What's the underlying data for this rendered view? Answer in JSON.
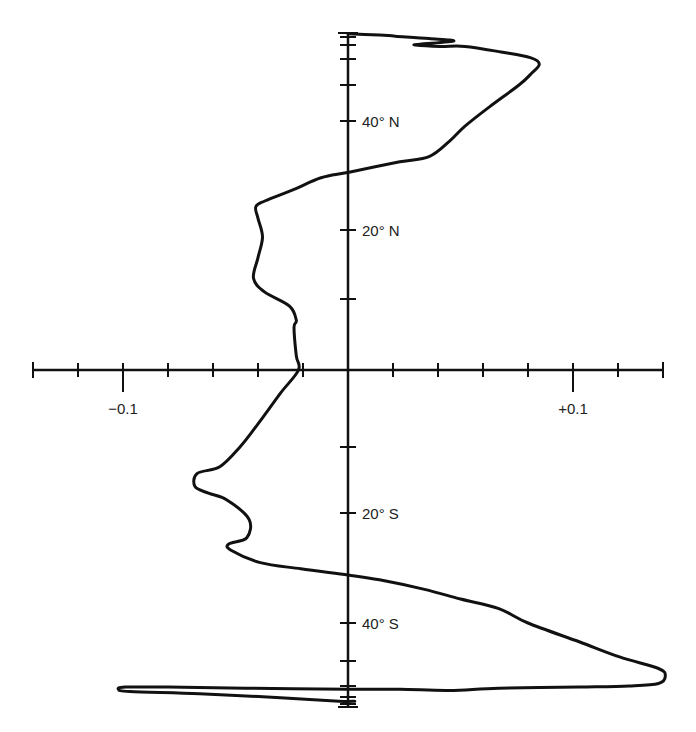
{
  "chart_data": {
    "type": "line",
    "title": "",
    "xlabel": "",
    "ylabel": "",
    "x_ticks": [
      -0.14,
      -0.12,
      -0.1,
      -0.08,
      -0.06,
      -0.04,
      -0.02,
      0,
      0.02,
      0.04,
      0.06,
      0.08,
      0.1,
      0.12,
      0.14
    ],
    "x_tick_labels": [
      {
        "value": -0.1,
        "label": "−0.1"
      },
      {
        "value": 0.1,
        "label": "+0.1"
      }
    ],
    "xlim": [
      -0.14,
      0.14
    ],
    "y_ticks_lat": [
      -90,
      -80,
      -70,
      -60,
      -50,
      -40,
      -20,
      -10,
      0,
      10,
      20,
      40,
      50,
      60,
      70,
      80,
      90
    ],
    "y_tick_labels": [
      {
        "lat": 40,
        "label": "40° N"
      },
      {
        "lat": 20,
        "label": "20° N"
      },
      {
        "lat": -20,
        "label": "20° S"
      },
      {
        "lat": -40,
        "label": "40° S"
      }
    ],
    "ylim": [
      -90,
      90
    ],
    "grid": false,
    "legend": null,
    "series": [
      {
        "name": "meridional profile",
        "points": [
          {
            "x": 0.0,
            "lat": 88
          },
          {
            "x": 0.014,
            "lat": 85
          },
          {
            "x": 0.021,
            "lat": 82
          },
          {
            "x": 0.036,
            "lat": 78
          },
          {
            "x": 0.047,
            "lat": 75
          },
          {
            "x": 0.032,
            "lat": 71
          },
          {
            "x": 0.03,
            "lat": 70
          },
          {
            "x": 0.041,
            "lat": 69
          },
          {
            "x": 0.052,
            "lat": 69
          },
          {
            "x": 0.068,
            "lat": 65
          },
          {
            "x": 0.081,
            "lat": 61
          },
          {
            "x": 0.085,
            "lat": 58
          },
          {
            "x": 0.081,
            "lat": 54
          },
          {
            "x": 0.076,
            "lat": 50
          },
          {
            "x": 0.063,
            "lat": 44
          },
          {
            "x": 0.052,
            "lat": 39
          },
          {
            "x": 0.045,
            "lat": 36
          },
          {
            "x": 0.036,
            "lat": 33
          },
          {
            "x": 0.023,
            "lat": 32
          },
          {
            "x": 0.001,
            "lat": 30
          },
          {
            "x": -0.012,
            "lat": 29
          },
          {
            "x": -0.024,
            "lat": 27
          },
          {
            "x": -0.037,
            "lat": 25
          },
          {
            "x": -0.041,
            "lat": 24
          },
          {
            "x": -0.04,
            "lat": 22
          },
          {
            "x": -0.038,
            "lat": 19
          },
          {
            "x": -0.04,
            "lat": 16
          },
          {
            "x": -0.042,
            "lat": 13
          },
          {
            "x": -0.037,
            "lat": 11
          },
          {
            "x": -0.026,
            "lat": 9
          },
          {
            "x": -0.023,
            "lat": 7
          },
          {
            "x": -0.024,
            "lat": 6
          },
          {
            "x": -0.023,
            "lat": 2
          },
          {
            "x": -0.022,
            "lat": 0
          },
          {
            "x": -0.03,
            "lat": -3
          },
          {
            "x": -0.04,
            "lat": -7
          },
          {
            "x": -0.048,
            "lat": -10
          },
          {
            "x": -0.057,
            "lat": -13
          },
          {
            "x": -0.067,
            "lat": -14
          },
          {
            "x": -0.068,
            "lat": -16
          },
          {
            "x": -0.062,
            "lat": -17
          },
          {
            "x": -0.054,
            "lat": -18
          },
          {
            "x": -0.044,
            "lat": -21
          },
          {
            "x": -0.045,
            "lat": -24
          },
          {
            "x": -0.053,
            "lat": -25
          },
          {
            "x": -0.052,
            "lat": -26
          },
          {
            "x": -0.039,
            "lat": -28
          },
          {
            "x": -0.021,
            "lat": -29
          },
          {
            "x": 0.0,
            "lat": -30
          },
          {
            "x": 0.014,
            "lat": -31
          },
          {
            "x": 0.034,
            "lat": -33
          },
          {
            "x": 0.05,
            "lat": -35
          },
          {
            "x": 0.067,
            "lat": -37
          },
          {
            "x": 0.08,
            "lat": -40
          },
          {
            "x": 0.103,
            "lat": -45
          },
          {
            "x": 0.121,
            "lat": -49
          },
          {
            "x": 0.138,
            "lat": -53
          },
          {
            "x": 0.141,
            "lat": -56
          },
          {
            "x": 0.138,
            "lat": -59
          },
          {
            "x": 0.125,
            "lat": -60
          },
          {
            "x": 0.103,
            "lat": -61
          },
          {
            "x": 0.067,
            "lat": -62
          },
          {
            "x": 0.045,
            "lat": -64
          },
          {
            "x": 0.023,
            "lat": -63
          },
          {
            "x": 0.0,
            "lat": -63
          },
          {
            "x": -0.044,
            "lat": -62
          },
          {
            "x": -0.08,
            "lat": -61
          },
          {
            "x": -0.099,
            "lat": -61
          },
          {
            "x": -0.102,
            "lat": -63
          },
          {
            "x": -0.097,
            "lat": -65
          },
          {
            "x": -0.066,
            "lat": -67
          },
          {
            "x": -0.03,
            "lat": -71
          },
          {
            "x": -0.004,
            "lat": -76
          },
          {
            "x": 0.003,
            "lat": -76
          }
        ]
      }
    ],
    "lat_pixel_map": {
      "90": 33,
      "80": 37,
      "70": 45,
      "60": 59,
      "50": 85,
      "40": 121,
      "30": 172,
      "20": 230,
      "10": 299,
      "0": 370,
      "-10": 447,
      "-20": 513,
      "-30": 575,
      "-40": 623,
      "-50": 661,
      "-60": 686,
      "-70": 697,
      "-80": 704,
      "-90": 707
    }
  },
  "style": {
    "line_color": "#111111",
    "axis_color": "#111111",
    "background": "#ffffff"
  }
}
